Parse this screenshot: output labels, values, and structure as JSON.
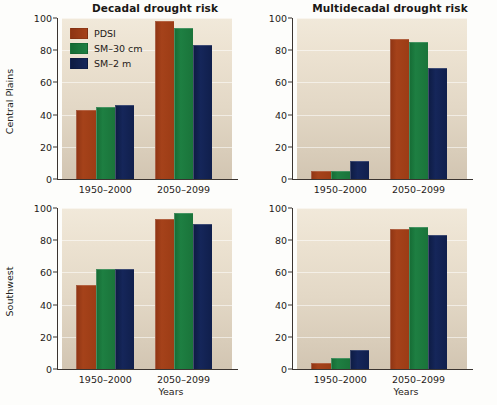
{
  "figure": {
    "xaxis_title": "Years",
    "row_labels": [
      "Central Plains",
      "Southwest"
    ],
    "column_titles": [
      "Decadal drought risk",
      "Multidecadal drought risk"
    ]
  },
  "legend": {
    "entries": [
      {
        "label": "PDSI",
        "color": "#A3421A",
        "key": "pdsi"
      },
      {
        "label": "SM–30 cm",
        "color": "#1E7F42",
        "key": "sm30"
      },
      {
        "label": "SM–2 m",
        "color": "#15265A",
        "key": "sm2"
      }
    ]
  },
  "axis": {
    "yticks": [
      "0",
      "20",
      "40",
      "60",
      "80",
      "100"
    ],
    "ymin": 0,
    "ymax": 100,
    "categories": [
      "1950–2000",
      "2050–2099"
    ]
  },
  "chart_data": [
    {
      "type": "bar",
      "title": "Decadal drought risk",
      "row": "Central Plains",
      "panel_id": "panel-0-0",
      "xlabel": "Years",
      "ylabel": "Central Plains",
      "ylim": [
        0,
        100
      ],
      "yticks": [
        0,
        20,
        40,
        60,
        80,
        100
      ],
      "grid": true,
      "legend_position": "top-left-inside",
      "categories": [
        "1950–2000",
        "2050–2099"
      ],
      "series": [
        {
          "name": "PDSI",
          "color": "#A3421A",
          "values": [
            43,
            98
          ]
        },
        {
          "name": "SM–30 cm",
          "color": "#1E7F42",
          "values": [
            45,
            94
          ]
        },
        {
          "name": "SM–2 m",
          "color": "#15265A",
          "values": [
            46,
            83
          ]
        }
      ]
    },
    {
      "type": "bar",
      "title": "Multidecadal drought risk",
      "row": "Central Plains",
      "panel_id": "panel-0-1",
      "xlabel": "Years",
      "ylabel": "Central Plains",
      "ylim": [
        0,
        100
      ],
      "yticks": [
        0,
        20,
        40,
        60,
        80,
        100
      ],
      "grid": true,
      "legend_position": "none",
      "categories": [
        "1950–2000",
        "2050–2099"
      ],
      "series": [
        {
          "name": "PDSI",
          "color": "#A3421A",
          "values": [
            5,
            87
          ]
        },
        {
          "name": "SM–30 cm",
          "color": "#1E7F42",
          "values": [
            5,
            85
          ]
        },
        {
          "name": "SM–2 m",
          "color": "#15265A",
          "values": [
            11,
            69
          ]
        }
      ]
    },
    {
      "type": "bar",
      "title": "Decadal drought risk",
      "row": "Southwest",
      "panel_id": "panel-1-0",
      "xlabel": "Years",
      "ylabel": "Southwest",
      "ylim": [
        0,
        100
      ],
      "yticks": [
        0,
        20,
        40,
        60,
        80,
        100
      ],
      "grid": true,
      "legend_position": "none",
      "categories": [
        "1950–2000",
        "2050–2099"
      ],
      "series": [
        {
          "name": "PDSI",
          "color": "#A3421A",
          "values": [
            52,
            93
          ]
        },
        {
          "name": "SM–30 cm",
          "color": "#1E7F42",
          "values": [
            62,
            97
          ]
        },
        {
          "name": "SM–2 m",
          "color": "#15265A",
          "values": [
            62,
            90
          ]
        }
      ]
    },
    {
      "type": "bar",
      "title": "Multidecadal drought risk",
      "row": "Southwest",
      "panel_id": "panel-1-1",
      "xlabel": "Years",
      "ylabel": "Southwest",
      "ylim": [
        0,
        100
      ],
      "yticks": [
        0,
        20,
        40,
        60,
        80,
        100
      ],
      "grid": true,
      "legend_position": "none",
      "categories": [
        "1950–2000",
        "2050–2099"
      ],
      "series": [
        {
          "name": "PDSI",
          "color": "#A3421A",
          "values": [
            4,
            87
          ]
        },
        {
          "name": "SM–30 cm",
          "color": "#1E7F42",
          "values": [
            7,
            88
          ]
        },
        {
          "name": "SM–2 m",
          "color": "#15265A",
          "values": [
            12,
            83
          ]
        }
      ]
    }
  ]
}
